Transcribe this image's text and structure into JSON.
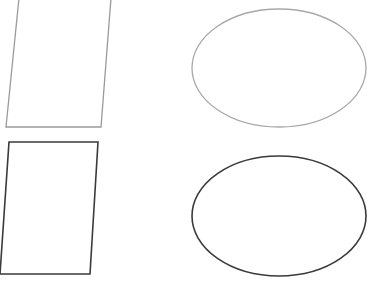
{
  "shapes": {
    "parallelogram_top": {
      "stroke": "#9a9a9a",
      "points": "19,-2 111,-2 101,127 6,127",
      "stroke_width": 1.3
    },
    "parallelogram_bottom": {
      "stroke": "#3a3a3a",
      "points": "9,142 98,142 90,274 0,274",
      "stroke_width": 1.6
    },
    "ellipse_top": {
      "stroke": "#a8a8a8",
      "cx": 279,
      "cy": 68,
      "rx": 87,
      "ry": 59,
      "stroke_width": 1.3
    },
    "ellipse_bottom": {
      "stroke": "#3a3a3a",
      "cx": 279,
      "cy": 216,
      "rx": 87,
      "ry": 60,
      "stroke_width": 1.6
    }
  }
}
